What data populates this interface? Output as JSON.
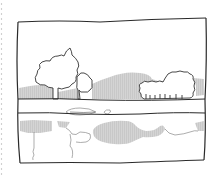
{
  "illustration": {
    "subject": "hand-drawn landscape sketch with trees, hills and reflection in water",
    "style": "ink outline with gray hatched shading",
    "colors": {
      "ink": "#2a2a2a",
      "shade": "#c8c8c8",
      "margin_dots": "#b0b0b0",
      "background": "#ffffff"
    },
    "elements": [
      "frame",
      "trees",
      "hills",
      "shoreline",
      "water",
      "reflection",
      "notebook-margin-dots"
    ]
  }
}
